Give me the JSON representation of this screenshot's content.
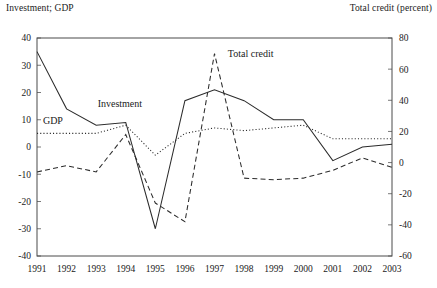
{
  "header": {
    "left_axis_title": "Investment; GDP",
    "right_axis_title": "Total credit (percent)"
  },
  "chart_data": {
    "type": "line",
    "title": "",
    "xlabel": "",
    "ylabel": "Investment; GDP",
    "y2label": "Total credit (percent)",
    "grid": false,
    "legend": "inline-annotations",
    "x": [
      1991,
      1992,
      1993,
      1994,
      1995,
      1996,
      1997,
      1998,
      1999,
      2000,
      2001,
      2002,
      2003
    ],
    "xticklabels": [
      "1991",
      "1992",
      "1993",
      "1994",
      "1995",
      "1996",
      "1997",
      "1998",
      "1999",
      "2000",
      "2001",
      "2002",
      "2003"
    ],
    "ylim": [
      -40,
      40
    ],
    "yticks": [
      -40,
      -30,
      -20,
      -10,
      0,
      10,
      20,
      30,
      40
    ],
    "yticklabels": [
      "-40",
      "-30",
      "-20",
      "-10",
      "0",
      "10",
      "20",
      "30",
      "40"
    ],
    "y2lim": [
      -60,
      80
    ],
    "y2ticks": [
      -60,
      -40,
      -20,
      0,
      20,
      40,
      60,
      80
    ],
    "y2ticklabels": [
      "-60",
      "-40",
      "-20",
      "0",
      "20",
      "40",
      "60",
      "80"
    ],
    "series": [
      {
        "name": "Investment",
        "axis": "left",
        "style": "solid",
        "label_x": 1993.05,
        "label_y": 14.5,
        "values": [
          35,
          14,
          8,
          9,
          -30,
          17,
          21,
          17,
          10,
          10,
          -5,
          0,
          1
        ]
      },
      {
        "name": "GDP",
        "axis": "left",
        "style": "dotted",
        "label_x": 1991.2,
        "label_y": 8.5,
        "values": [
          5,
          5,
          5,
          8,
          -3,
          5,
          7,
          6,
          7,
          8,
          3,
          3,
          3
        ]
      },
      {
        "name": "Total credit",
        "axis": "right",
        "style": "dashed",
        "label_x": 1997.45,
        "label_y": 68,
        "values": [
          -6,
          -2,
          -6,
          18,
          -26,
          -38,
          70,
          -10,
          -11,
          -10,
          -5,
          3,
          -3
        ]
      }
    ]
  }
}
